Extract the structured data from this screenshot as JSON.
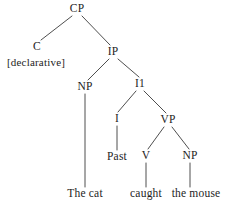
{
  "figure": {
    "type": "syntax-tree",
    "background_color": "#ffffff",
    "line_color": "#3a3a3a",
    "text_color": "#1d1d1d",
    "sentence": "The cat caught the mouse"
  },
  "nodes": [
    {
      "id": "cp",
      "label": "CP",
      "x": 77,
      "y": 9,
      "kind": "nonterminal"
    },
    {
      "id": "c",
      "label": "C",
      "x": 37,
      "y": 47,
      "kind": "nonterminal"
    },
    {
      "id": "declarative",
      "label": "[declarative]",
      "x": 36,
      "y": 62,
      "kind": "feature"
    },
    {
      "id": "ip",
      "label": "IP",
      "x": 113,
      "y": 52,
      "kind": "nonterminal"
    },
    {
      "id": "np1",
      "label": "NP",
      "x": 85,
      "y": 87,
      "kind": "nonterminal"
    },
    {
      "id": "i1",
      "label": "I1",
      "x": 140,
      "y": 84,
      "kind": "nonterminal"
    },
    {
      "id": "i",
      "label": "I",
      "x": 117,
      "y": 119,
      "kind": "nonterminal"
    },
    {
      "id": "vp",
      "label": "VP",
      "x": 168,
      "y": 120,
      "kind": "nonterminal"
    },
    {
      "id": "past",
      "label": "Past",
      "x": 117,
      "y": 157,
      "kind": "terminal"
    },
    {
      "id": "v",
      "label": "V",
      "x": 146,
      "y": 156,
      "kind": "nonterminal"
    },
    {
      "id": "np2",
      "label": "NP",
      "x": 190,
      "y": 156,
      "kind": "nonterminal"
    },
    {
      "id": "the_cat",
      "label": "The cat",
      "x": 85,
      "y": 194,
      "kind": "terminal"
    },
    {
      "id": "caught",
      "label": "caught",
      "x": 146,
      "y": 194,
      "kind": "terminal"
    },
    {
      "id": "the_mouse",
      "label": "the mouse",
      "x": 196,
      "y": 194,
      "kind": "terminal"
    }
  ],
  "edges": [
    {
      "from": "cp",
      "to": "c",
      "x1": 72,
      "y1": 16,
      "x2": 41,
      "y2": 40
    },
    {
      "from": "cp",
      "to": "ip",
      "x1": 82,
      "y1": 16,
      "x2": 110,
      "y2": 45
    },
    {
      "from": "ip",
      "to": "np1",
      "x1": 109,
      "y1": 59,
      "x2": 88,
      "y2": 80
    },
    {
      "from": "ip",
      "to": "i1",
      "x1": 118,
      "y1": 59,
      "x2": 139,
      "y2": 77
    },
    {
      "from": "i1",
      "to": "i",
      "x1": 136,
      "y1": 91,
      "x2": 118,
      "y2": 112
    },
    {
      "from": "i1",
      "to": "vp",
      "x1": 144,
      "y1": 91,
      "x2": 166,
      "y2": 113
    },
    {
      "from": "i",
      "to": "past",
      "x1": 117,
      "y1": 126,
      "x2": 117,
      "y2": 150
    },
    {
      "from": "vp",
      "to": "v",
      "x1": 164,
      "y1": 127,
      "x2": 148,
      "y2": 149
    },
    {
      "from": "vp",
      "to": "np2",
      "x1": 172,
      "y1": 127,
      "x2": 189,
      "y2": 149
    },
    {
      "from": "np1",
      "to": "the_cat",
      "x1": 85,
      "y1": 94,
      "x2": 85,
      "y2": 187
    },
    {
      "from": "v",
      "to": "caught",
      "x1": 146,
      "y1": 163,
      "x2": 146,
      "y2": 187
    },
    {
      "from": "np2",
      "to": "the_mouse",
      "x1": 190,
      "y1": 163,
      "x2": 190,
      "y2": 187
    }
  ]
}
